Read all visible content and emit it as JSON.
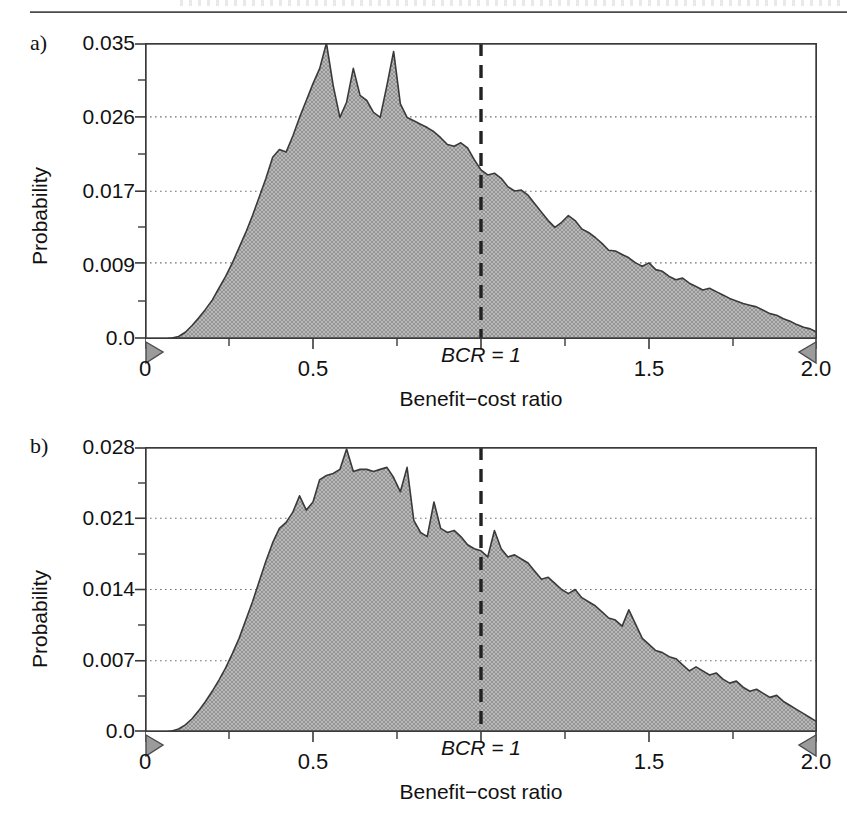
{
  "figure": {
    "header_rule": "horizontal-rule",
    "background": "#ffffff",
    "fill_color": "#a9a9a9",
    "line_color": "#3a3a3a",
    "grid_color": "#808080"
  },
  "panels": [
    {
      "letter": "a)",
      "ylabel": "Probability",
      "xlabel": "Benefit−cost ratio",
      "yticks": [
        "0.0",
        "0.009",
        "0.017",
        "0.026",
        "0.035"
      ],
      "xticks": [
        "0",
        "0.5",
        "1.5",
        "2.0"
      ],
      "reference_line_label": "BCR = 1",
      "markers": [
        "left-range-marker",
        "right-range-marker"
      ]
    },
    {
      "letter": "b)",
      "ylabel": "Probability",
      "xlabel": "Benefit−cost ratio",
      "yticks": [
        "0.0",
        "0.007",
        "0.014",
        "0.021",
        "0.028"
      ],
      "xticks": [
        "0",
        "0.5",
        "1.5",
        "2.0"
      ],
      "reference_line_label": "BCR = 1",
      "markers": [
        "left-range-marker",
        "right-range-marker"
      ]
    }
  ],
  "chart_data": [
    {
      "id": "panel-a",
      "type": "area",
      "title": "a)",
      "xlabel": "Benefit−cost ratio",
      "ylabel": "Probability",
      "xlim": [
        0.0,
        2.0
      ],
      "ylim": [
        0.0,
        0.035
      ],
      "xticks": [
        0.0,
        0.5,
        1.0,
        1.5,
        2.0
      ],
      "xticklabels": [
        "0",
        "0.5",
        "BCR = 1",
        "1.5",
        "2.0"
      ],
      "yticks": [
        0.0,
        0.009,
        0.017,
        0.026,
        0.035
      ],
      "yticklabels": [
        "0.0",
        "0.009",
        "0.017",
        "0.026",
        "0.035"
      ],
      "grid": "horizontal-dotted",
      "legend": null,
      "annotations": [
        {
          "text": "BCR = 1",
          "type": "vertical-dashed-line",
          "x": 1.0
        },
        {
          "text": "",
          "type": "range-marker-left",
          "x": 0.0
        },
        {
          "text": "",
          "type": "range-marker-right",
          "x": 2.0
        }
      ],
      "x": [
        0.0,
        0.02,
        0.04,
        0.06,
        0.08,
        0.1,
        0.12,
        0.14,
        0.16,
        0.18,
        0.2,
        0.22,
        0.24,
        0.26,
        0.28,
        0.3,
        0.32,
        0.34,
        0.36,
        0.38,
        0.4,
        0.42,
        0.44,
        0.46,
        0.48,
        0.5,
        0.52,
        0.54,
        0.56,
        0.58,
        0.6,
        0.62,
        0.64,
        0.66,
        0.68,
        0.7,
        0.72,
        0.74,
        0.76,
        0.78,
        0.8,
        0.82,
        0.84,
        0.86,
        0.88,
        0.9,
        0.92,
        0.94,
        0.96,
        0.98,
        1.0,
        1.02,
        1.04,
        1.06,
        1.08,
        1.1,
        1.12,
        1.14,
        1.16,
        1.18,
        1.2,
        1.22,
        1.24,
        1.26,
        1.28,
        1.3,
        1.32,
        1.34,
        1.36,
        1.38,
        1.4,
        1.42,
        1.44,
        1.46,
        1.48,
        1.5,
        1.52,
        1.54,
        1.56,
        1.58,
        1.6,
        1.62,
        1.64,
        1.66,
        1.68,
        1.7,
        1.72,
        1.74,
        1.76,
        1.78,
        1.8,
        1.82,
        1.84,
        1.86,
        1.88,
        1.9,
        1.92,
        1.94,
        1.96,
        1.98,
        2.0
      ],
      "y": [
        0.0,
        0.0,
        0.0,
        0.0,
        0.0001,
        0.0003,
        0.0008,
        0.0016,
        0.0025,
        0.0035,
        0.0046,
        0.006,
        0.0074,
        0.009,
        0.0108,
        0.0126,
        0.0146,
        0.0168,
        0.019,
        0.0215,
        0.0224,
        0.0221,
        0.024,
        0.0262,
        0.0282,
        0.0302,
        0.032,
        0.035,
        0.03,
        0.0262,
        0.028,
        0.032,
        0.0288,
        0.0282,
        0.0268,
        0.0262,
        0.03,
        0.034,
        0.0278,
        0.0262,
        0.0258,
        0.0254,
        0.025,
        0.0245,
        0.0238,
        0.023,
        0.0228,
        0.0232,
        0.0226,
        0.0212,
        0.02,
        0.0194,
        0.0196,
        0.019,
        0.018,
        0.0175,
        0.0176,
        0.017,
        0.016,
        0.015,
        0.014,
        0.0132,
        0.0138,
        0.0146,
        0.014,
        0.013,
        0.0126,
        0.012,
        0.0113,
        0.0105,
        0.0104,
        0.01,
        0.0096,
        0.009,
        0.0086,
        0.009,
        0.0082,
        0.008,
        0.0074,
        0.007,
        0.0072,
        0.0066,
        0.0062,
        0.0058,
        0.006,
        0.0056,
        0.0052,
        0.0048,
        0.0045,
        0.0042,
        0.004,
        0.0038,
        0.0034,
        0.003,
        0.0028,
        0.0024,
        0.0021,
        0.0017,
        0.0014,
        0.0012,
        0.0008
      ]
    },
    {
      "id": "panel-b",
      "type": "area",
      "title": "b)",
      "xlabel": "Benefit−cost ratio",
      "ylabel": "Probability",
      "xlim": [
        0.0,
        2.0
      ],
      "ylim": [
        0.0,
        0.028
      ],
      "xticks": [
        0.0,
        0.5,
        1.0,
        1.5,
        2.0
      ],
      "xticklabels": [
        "0",
        "0.5",
        "BCR = 1",
        "1.5",
        "2.0"
      ],
      "yticks": [
        0.0,
        0.007,
        0.014,
        0.021,
        0.028
      ],
      "yticklabels": [
        "0.0",
        "0.007",
        "0.014",
        "0.021",
        "0.028"
      ],
      "grid": "horizontal-dotted",
      "legend": null,
      "annotations": [
        {
          "text": "BCR = 1",
          "type": "vertical-dashed-line",
          "x": 1.0
        },
        {
          "text": "",
          "type": "range-marker-left",
          "x": 0.0
        },
        {
          "text": "",
          "type": "range-marker-right",
          "x": 2.0
        }
      ],
      "x": [
        0.0,
        0.02,
        0.04,
        0.06,
        0.08,
        0.1,
        0.12,
        0.14,
        0.16,
        0.18,
        0.2,
        0.22,
        0.24,
        0.26,
        0.28,
        0.3,
        0.32,
        0.34,
        0.36,
        0.38,
        0.4,
        0.42,
        0.44,
        0.46,
        0.48,
        0.5,
        0.52,
        0.54,
        0.56,
        0.58,
        0.6,
        0.62,
        0.64,
        0.66,
        0.68,
        0.7,
        0.72,
        0.74,
        0.76,
        0.78,
        0.8,
        0.82,
        0.84,
        0.86,
        0.88,
        0.9,
        0.92,
        0.94,
        0.96,
        0.98,
        1.0,
        1.02,
        1.04,
        1.06,
        1.08,
        1.1,
        1.12,
        1.14,
        1.16,
        1.18,
        1.2,
        1.22,
        1.24,
        1.26,
        1.28,
        1.3,
        1.32,
        1.34,
        1.36,
        1.38,
        1.4,
        1.42,
        1.44,
        1.46,
        1.48,
        1.5,
        1.52,
        1.54,
        1.56,
        1.58,
        1.6,
        1.62,
        1.64,
        1.66,
        1.68,
        1.7,
        1.72,
        1.74,
        1.76,
        1.78,
        1.8,
        1.82,
        1.84,
        1.86,
        1.88,
        1.9,
        1.92,
        1.94,
        1.96,
        1.98,
        2.0
      ],
      "y": [
        0.0,
        0.0,
        0.0,
        0.0,
        0.0001,
        0.0003,
        0.0007,
        0.0013,
        0.0021,
        0.003,
        0.004,
        0.0051,
        0.0063,
        0.0077,
        0.0092,
        0.011,
        0.0128,
        0.0148,
        0.0168,
        0.0186,
        0.02,
        0.0206,
        0.0216,
        0.0232,
        0.0218,
        0.0226,
        0.0248,
        0.0252,
        0.0254,
        0.0258,
        0.0278,
        0.0256,
        0.0258,
        0.0258,
        0.0256,
        0.0258,
        0.026,
        0.025,
        0.0236,
        0.026,
        0.0208,
        0.0196,
        0.0192,
        0.0226,
        0.02,
        0.0196,
        0.0198,
        0.0192,
        0.0184,
        0.018,
        0.0178,
        0.0172,
        0.0198,
        0.018,
        0.0172,
        0.0174,
        0.017,
        0.0166,
        0.0158,
        0.015,
        0.0152,
        0.0146,
        0.014,
        0.0136,
        0.014,
        0.0132,
        0.0128,
        0.0124,
        0.0118,
        0.0112,
        0.011,
        0.0104,
        0.012,
        0.0106,
        0.0092,
        0.0086,
        0.008,
        0.0078,
        0.0074,
        0.0072,
        0.0066,
        0.006,
        0.0064,
        0.006,
        0.0056,
        0.0058,
        0.0052,
        0.0048,
        0.005,
        0.0044,
        0.004,
        0.0042,
        0.0038,
        0.0034,
        0.0036,
        0.003,
        0.0026,
        0.0022,
        0.0018,
        0.0014,
        0.001
      ]
    }
  ]
}
